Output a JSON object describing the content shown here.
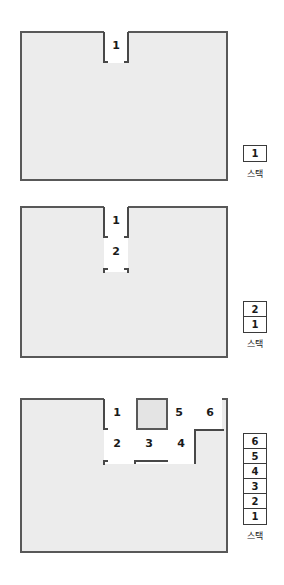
{
  "page": {
    "background_color": "#ffffff",
    "maze_fill_color": "#ececec",
    "wall_color": "#585858",
    "corridor_color": "#ffffff",
    "label_color": "#1a1a1a"
  },
  "stack_caption": "스택",
  "figures": [
    {
      "id": "figure-1",
      "step": 1,
      "cell_labels": [
        "1"
      ],
      "stack_items": [
        "1"
      ],
      "stack_caption": "스택"
    },
    {
      "id": "figure-2",
      "step": 2,
      "cell_labels": [
        "1",
        "2"
      ],
      "stack_items": [
        "2",
        "1"
      ],
      "stack_caption": "스택"
    },
    {
      "id": "figure-3",
      "step": 3,
      "cell_labels": [
        "1",
        "5",
        "6",
        "2",
        "3",
        "4"
      ],
      "stack_items": [
        "6",
        "5",
        "4",
        "3",
        "2",
        "1"
      ],
      "stack_caption": "스택"
    }
  ]
}
